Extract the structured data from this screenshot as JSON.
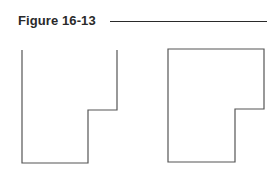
{
  "figure": {
    "title": "Figure 16-13",
    "shapes": [
      {
        "name": "open-top-l-shape",
        "points": "22,50 22,163 88,163 88,110 117,110 117,50",
        "closed": false
      },
      {
        "name": "closed-l-shape",
        "points": "168,49 264,49 264,109 235,109 235,162 168,162",
        "closed": true
      }
    ],
    "stroke_color": "#555555"
  }
}
